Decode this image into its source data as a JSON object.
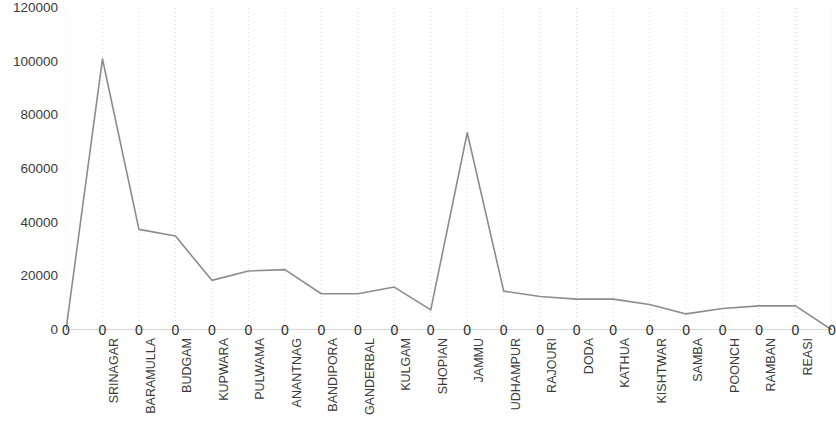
{
  "chart_data": {
    "type": "line",
    "title": "",
    "subtitle": "",
    "xlabel": "",
    "ylabel": "",
    "ylim": [
      0,
      120000
    ],
    "ytick_values": [
      0,
      20000,
      40000,
      60000,
      80000,
      100000,
      120000
    ],
    "ytick_labels": [
      "0",
      "20000",
      "40000",
      "60000",
      "80000",
      "100000",
      "120000"
    ],
    "grid": "vertical-dotted",
    "legend": "none",
    "line_color": "#8c8c8c",
    "categories": [
      "",
      "SRINAGAR",
      "BARAMULLA",
      "BUDGAM",
      "KUPWARA",
      "PULWAMA",
      "ANANTNAG",
      "BANDIPORA",
      "GANDERBAL",
      "KULGAM",
      "SHOPIAN",
      "JAMMU",
      "UDHAMPUR",
      "RAJOURI",
      "DODA",
      "KATHUA",
      "KISHTWAR",
      "SAMBA",
      "POONCH",
      "RAMBAN",
      "REASI",
      ""
    ],
    "values": [
      0,
      101000,
      37500,
      35000,
      18500,
      22000,
      22500,
      13500,
      13500,
      16000,
      7500,
      73500,
      14500,
      12500,
      11500,
      11500,
      9500,
      6000,
      8000,
      9000,
      9000,
      0
    ],
    "data_labels": [
      "0",
      "0",
      "0",
      "0",
      "0",
      "0",
      "0",
      "0",
      "0",
      "0",
      "0",
      "0",
      "0",
      "0",
      "0",
      "0",
      "0",
      "0",
      "0",
      "0",
      "0",
      "0"
    ]
  }
}
